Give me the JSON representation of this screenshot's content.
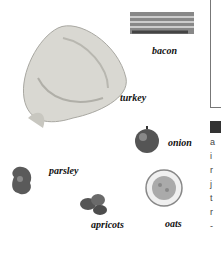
{
  "items": [
    {
      "name": "bacon",
      "label": "bacon"
    },
    {
      "name": "turkey",
      "label": "turkey"
    },
    {
      "name": "onion",
      "label": "onion"
    },
    {
      "name": "parsley",
      "label": "parsley"
    },
    {
      "name": "apricots",
      "label": "apricots"
    },
    {
      "name": "oats",
      "label": "oats"
    }
  ],
  "edge_text": [
    "a",
    "i",
    "r",
    "j",
    "t",
    "r",
    "-"
  ]
}
